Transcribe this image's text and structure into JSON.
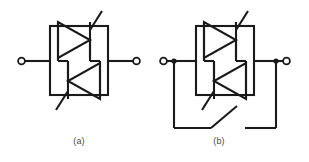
{
  "figure": {
    "title": "",
    "stroke_color": "#1a1a1a",
    "background_color": "#ffffff",
    "captions": [
      {
        "id": "a",
        "label": "(a)"
      },
      {
        "id": "b",
        "label": "(b)"
      }
    ],
    "subfigures": [
      {
        "id": "a",
        "label": "(a)",
        "description": "Two thyristors connected in anti-parallel inside a rectangular enclosure with two external terminals",
        "terminals": 2,
        "devices": [
          {
            "type": "thyristor",
            "name": "thyristor-top",
            "orientation": "left-to-right",
            "gate_direction": "up-right"
          },
          {
            "type": "thyristor",
            "name": "thyristor-bottom",
            "orientation": "right-to-left",
            "gate_direction": "down-left"
          }
        ],
        "has_bypass_switch": false
      },
      {
        "id": "b",
        "label": "(b)",
        "description": "Two anti-parallel thyristors in an enclosure with an external bypass branch containing an open switch",
        "terminals": 2,
        "devices": [
          {
            "type": "thyristor",
            "name": "thyristor-top",
            "orientation": "left-to-right",
            "gate_direction": "up-right"
          },
          {
            "type": "thyristor",
            "name": "thyristor-bottom",
            "orientation": "right-to-left",
            "gate_direction": "down-left"
          }
        ],
        "has_bypass_switch": true,
        "switch": {
          "name": "bypass-switch",
          "state": "open"
        },
        "junction_dots": 2
      }
    ]
  }
}
